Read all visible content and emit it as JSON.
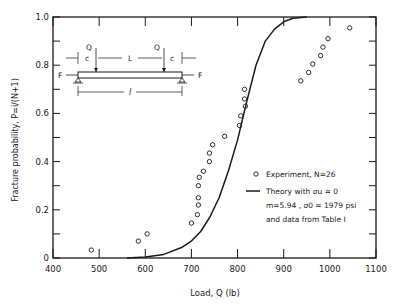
{
  "chart_data": {
    "type": "scatter",
    "title": "",
    "xlabel": "Load, Q (lb)",
    "ylabel": "Fracture probability, P=i/(N+1)",
    "xlim": [
      400,
      1100
    ],
    "ylim": [
      0,
      1.0
    ],
    "x_ticks": [
      400,
      500,
      600,
      700,
      800,
      900,
      1000,
      1100
    ],
    "x_tick_labels": [
      "400",
      "500",
      "600",
      "700",
      "800",
      "900",
      "1000",
      "1100"
    ],
    "y_ticks": [
      0,
      0.2,
      0.4,
      0.6,
      0.8,
      1.0
    ],
    "y_tick_labels": [
      "0",
      "0.2",
      "0.4",
      "0.6",
      "0.8",
      "1.0"
    ],
    "grid": false,
    "legend_position": "lower right inside",
    "series": [
      {
        "name": "Experiment, N=26",
        "type": "scatter",
        "marker": "open-circle",
        "x": [
          483,
          585,
          604,
          700,
          713,
          715,
          715,
          715,
          717,
          726,
          739,
          739,
          746,
          772,
          804,
          807,
          817,
          815,
          815,
          937,
          954,
          963,
          980,
          985,
          996,
          1043
        ],
        "y": [
          0.033,
          0.07,
          0.1,
          0.145,
          0.18,
          0.22,
          0.25,
          0.3,
          0.335,
          0.36,
          0.4,
          0.435,
          0.47,
          0.505,
          0.55,
          0.59,
          0.63,
          0.66,
          0.7,
          0.735,
          0.77,
          0.805,
          0.84,
          0.875,
          0.91,
          0.955
        ]
      },
      {
        "name": "Theory with σu=0 m=5.94, σ0=1979 psi and data from Table I",
        "type": "line",
        "x": [
          560,
          600,
          640,
          680,
          700,
          720,
          740,
          760,
          780,
          800,
          820,
          840,
          860,
          880,
          900,
          920,
          950
        ],
        "y": [
          0.0,
          0.004,
          0.015,
          0.045,
          0.07,
          0.11,
          0.17,
          0.25,
          0.36,
          0.49,
          0.65,
          0.8,
          0.9,
          0.95,
          0.98,
          0.995,
          1.0
        ]
      }
    ],
    "legend": [
      {
        "marker": "open-circle",
        "label": "Experiment, N=26"
      },
      {
        "marker": "line",
        "lines": [
          "Theory with σu = 0",
          "m=5.94 ,  σ0 = 1979 psi",
          "and  data  from  Table  I"
        ]
      }
    ],
    "inset_diagram": {
      "description": "Four-point bending beam with axial load",
      "labels": {
        "load_left": "Q",
        "load_right": "Q",
        "span_inner": "L",
        "overhang_left": "c",
        "overhang_right": "c",
        "axial_left": "F",
        "axial_right": "F",
        "span_total": "l"
      }
    }
  }
}
